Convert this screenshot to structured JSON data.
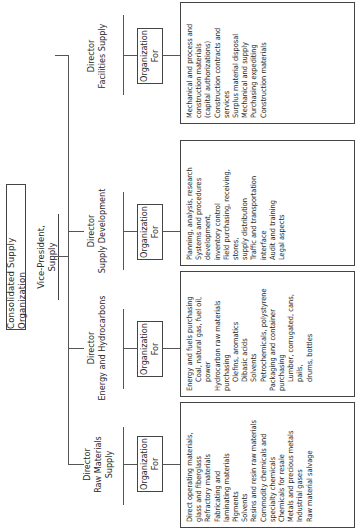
{
  "title": "Consolidated Supply Organization",
  "vp": "Vice-President, Supply",
  "org_label": [
    "Organization",
    "For"
  ],
  "directors": [
    {
      "key": "raw",
      "title_lines": [
        "Director",
        "Raw Materials",
        "Supply"
      ],
      "items": [
        {
          "text": "Direct operating materials,",
          "indent": false
        },
        {
          "text": "glass and fiberglass",
          "indent": false
        },
        {
          "text": "Refractory materials",
          "indent": false
        },
        {
          "text": "Fabricating and",
          "indent": false
        },
        {
          "text": "laminating materials",
          "indent": false
        },
        {
          "text": "Pigments",
          "indent": false
        },
        {
          "text": "Solvents",
          "indent": false
        },
        {
          "text": "Resins and resin raw materials",
          "indent": false
        },
        {
          "text": "Commodity chemicals and",
          "indent": false
        },
        {
          "text": "specialty chemicals",
          "indent": false
        },
        {
          "text": "Chemicals for resale",
          "indent": false
        },
        {
          "text": "Metals and precious metals",
          "indent": false
        },
        {
          "text": "Industrial gases",
          "indent": false
        },
        {
          "text": "Raw material salvage",
          "indent": false
        }
      ]
    },
    {
      "key": "energy",
      "title_lines": [
        "Director",
        "Energy and Hydrocarbons"
      ],
      "items": [
        {
          "text": "Energy and fuels purchasing",
          "indent": false
        },
        {
          "text": "Coal, natural gas, fuel oil,",
          "indent": true
        },
        {
          "text": "power",
          "indent": true
        },
        {
          "text": "Hydrocarbon raw materials purchasing",
          "indent": false
        },
        {
          "text": "Olefins, aromatics",
          "indent": true
        },
        {
          "text": "Dibasic acids",
          "indent": true
        },
        {
          "text": "Solvents",
          "indent": true
        },
        {
          "text": "Petrochemicals, polystyrene",
          "indent": true
        },
        {
          "text": "Packaging and container purchasing",
          "indent": false
        },
        {
          "text": "Lumber, corrugated, cans, pails,",
          "indent": true
        },
        {
          "text": "drums, bottles",
          "indent": true
        }
      ]
    },
    {
      "key": "development",
      "title_lines": [
        "Director",
        "Supply Development"
      ],
      "items": [
        {
          "text": "Planning, analysis, research",
          "indent": false
        },
        {
          "text": "Systems and procedures development,",
          "indent": false
        },
        {
          "text": "inventory control",
          "indent": false
        },
        {
          "text": "Field purchasing, receiving, stores,",
          "indent": false
        },
        {
          "text": "supply distribution",
          "indent": false
        },
        {
          "text": "Traffic and transportation interface",
          "indent": false
        },
        {
          "text": "Audit and training",
          "indent": false
        },
        {
          "text": "Legal aspects",
          "indent": false
        }
      ]
    },
    {
      "key": "facilities",
      "title_lines": [
        "Director",
        "Facilities Supply"
      ],
      "items": [
        {
          "text": "Mechanical and process and",
          "indent": false
        },
        {
          "text": "construction materials",
          "indent": false
        },
        {
          "text": "(capital authorizations)",
          "indent": false
        },
        {
          "text": "Construction contracts and",
          "indent": false
        },
        {
          "text": "services",
          "indent": false
        },
        {
          "text": "Surplus material disposal",
          "indent": false
        },
        {
          "text": "Mechanical and supply",
          "indent": false
        },
        {
          "text": "Purchasing expediting",
          "indent": false
        },
        {
          "text": "Construction materials",
          "indent": false
        }
      ]
    }
  ]
}
